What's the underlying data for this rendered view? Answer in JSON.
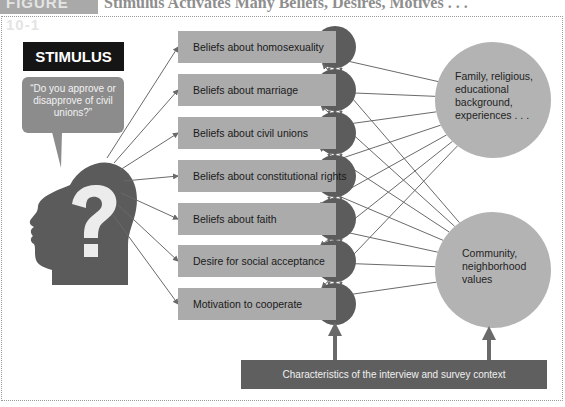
{
  "header": {
    "figure_label": "FIGURE 10-1",
    "title": "Stimulus Activates Many Beliefs, Desires, Motives . . ."
  },
  "stimulus": {
    "label": "STIMULUS",
    "question": "“Do you approve or disapprove of civil unions?”",
    "head_icon": "head-with-question-mark"
  },
  "considerations": [
    {
      "label": "Beliefs about homosexuality"
    },
    {
      "label": "Beliefs about marriage"
    },
    {
      "label": "Beliefs about civil unions"
    },
    {
      "label": "Beliefs about constitutional rights"
    },
    {
      "label": "Beliefs about faith"
    },
    {
      "label": "Desire for social acceptance"
    },
    {
      "label": "Motivation to cooperate"
    }
  ],
  "influences": [
    {
      "label": "Family, religious, educational background, experiences . . ."
    },
    {
      "label": "Community, neighborhood values"
    }
  ],
  "context": {
    "label": "Characteristics of the interview and survey context"
  },
  "colors": {
    "stimulus_box": "#151515",
    "bubble": "#8c8c8c",
    "head": "#5b5b5b",
    "consideration_box": "#ababab",
    "node": "#5c5c5c",
    "influence_circle": "#b3b3b3",
    "context_bar": "#5f5f5f",
    "arrow": "#6a6a6a"
  }
}
